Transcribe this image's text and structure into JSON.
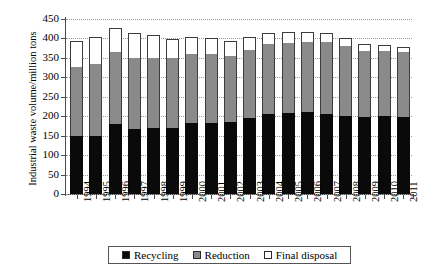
{
  "chart_data": {
    "type": "bar",
    "stacked": true,
    "title": "",
    "xlabel": "",
    "ylabel": "Industrial waste volume/million tons",
    "ylim": [
      0,
      450
    ],
    "ytick_step": 50,
    "yticks": [
      0,
      50,
      100,
      150,
      200,
      250,
      300,
      350,
      400,
      450
    ],
    "grid": true,
    "grid_axis": "y",
    "legend_position": "bottom",
    "categories": [
      "1994",
      "1995",
      "1996",
      "1997",
      "1998",
      "1999",
      "2000",
      "2001",
      "2002",
      "2003",
      "2004",
      "2005",
      "2006",
      "2007",
      "2008",
      "2009",
      "2010",
      "2011"
    ],
    "series": [
      {
        "name": "Recycling",
        "color": "#0a0a0a",
        "values": [
          148,
          150,
          181,
          168,
          171,
          170,
          183,
          182,
          184,
          196,
          207,
          208,
          211,
          207,
          201,
          197,
          201,
          199
        ]
      },
      {
        "name": "Reduction",
        "color": "#8a8a8a",
        "values": [
          178,
          185,
          184,
          181,
          180,
          180,
          178,
          177,
          170,
          174,
          178,
          180,
          179,
          184,
          180,
          172,
          168,
          166
        ]
      },
      {
        "name": "Final disposal",
        "color": "#ffffff",
        "values": [
          67,
          70,
          62,
          66,
          57,
          49,
          43,
          41,
          39,
          33,
          29,
          29,
          26,
          24,
          20,
          16,
          14,
          13
        ]
      }
    ],
    "totals": [
      393,
      405,
      427,
      415,
      408,
      399,
      404,
      400,
      393,
      403,
      414,
      417,
      416,
      415,
      401,
      385,
      383,
      378
    ]
  },
  "legend": {
    "items": [
      {
        "label": "Recycling",
        "swatch_class": "sw-recycling"
      },
      {
        "label": "Reduction",
        "swatch_class": "sw-reduction"
      },
      {
        "label": "Final disposal",
        "swatch_class": "sw-disposal"
      }
    ]
  }
}
